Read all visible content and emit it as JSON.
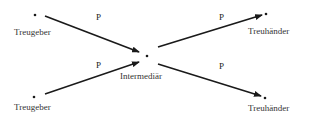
{
  "diagram": {
    "colors": {
      "line": "#1a1a1a",
      "text": "#333333",
      "background": "#ffffff"
    },
    "nodes": [
      {
        "id": "treugeber-top",
        "label": "Treugeber",
        "x": 35,
        "y": 15
      },
      {
        "id": "treugeber-bottom",
        "label": "Treugeber",
        "x": 34,
        "y": 97
      },
      {
        "id": "intermediaer",
        "label": "Intermediär",
        "x": 147,
        "y": 56
      },
      {
        "id": "treuhaender-top",
        "label": "Treuhänder",
        "x": 266,
        "y": 14
      },
      {
        "id": "treuhaender-bottom",
        "label": "Treuhänder",
        "x": 265,
        "y": 98
      }
    ],
    "edges": [
      {
        "from": "treugeber-top",
        "to": "intermediaer",
        "label": "P"
      },
      {
        "from": "treugeber-bottom",
        "to": "intermediaer",
        "label": "P"
      },
      {
        "from": "intermediaer",
        "to": "treuhaender-top",
        "label": "P"
      },
      {
        "from": "intermediaer",
        "to": "treuhaender-bottom",
        "label": "P"
      }
    ]
  }
}
